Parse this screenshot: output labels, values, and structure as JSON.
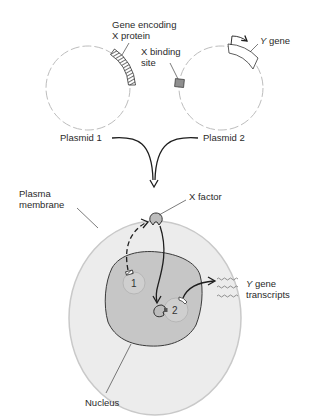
{
  "figure": {
    "type": "biology-diagram"
  },
  "plasmids": [
    {
      "id": 1,
      "label": "Plasmid 1",
      "feature_label_line1": "Gene encoding",
      "feature_label_line2": "X protein"
    },
    {
      "id": 2,
      "label": "Plasmid 2",
      "binding_site_label_line1": "X binding",
      "binding_site_label_line2": "site",
      "gene_label_italic": "Y",
      "gene_label_rest": " gene"
    }
  ],
  "cell": {
    "membrane_label_line1": "Plasma",
    "membrane_label_line2": "membrane",
    "factor_label": "X factor",
    "nucleus_label": "Nucleus",
    "plasmid_1_number": "1",
    "plasmid_2_number": "2",
    "transcripts_label_italic": "Y",
    "transcripts_label_line1_rest": " gene",
    "transcripts_label_line2": "transcripts"
  },
  "colors": {
    "background": "#ffffff",
    "plasmid_stroke": "#bdbdbd",
    "cytoplasm_fill": "#ececec",
    "membrane_stroke": "#c9c9c9",
    "nucleus_fill": "#c6c6c6",
    "nucleus_stroke": "#3a3a3a",
    "binding_site_fill": "#8f8f8f",
    "factor_fill": "#bcbcbc",
    "arrow": "#1e1e1e",
    "text": "#2a2a2a"
  }
}
